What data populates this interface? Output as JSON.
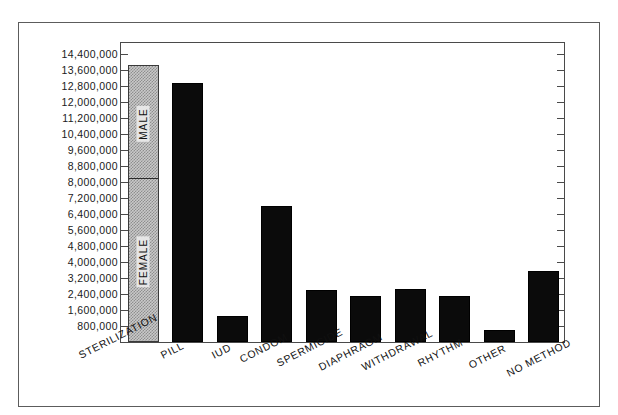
{
  "chart_data": {
    "type": "bar",
    "title": "",
    "subtitle": "",
    "xlabel": "",
    "ylabel": "",
    "grid": false,
    "legend_position": "in-bar",
    "ylim": [
      0,
      14800000
    ],
    "y_tick_step": 800000,
    "y_tick_labels": [
      "14,400,000",
      "13,600,000",
      "12,800,000",
      "12,000,000",
      "11,200,000",
      "10,400,000",
      "9,600,000",
      "8,800,000",
      "8,000,000",
      "7,200,000",
      "6,400,000",
      "5,600,000",
      "4,800,000",
      "4,000,000",
      "3,200,000",
      "2,400,000",
      "1,600,000",
      "800,000"
    ],
    "y_tick_values": [
      14400000,
      13600000,
      12800000,
      12000000,
      11200000,
      10400000,
      9600000,
      8800000,
      8000000,
      7200000,
      6400000,
      5600000,
      4800000,
      4000000,
      3200000,
      2400000,
      1600000,
      800000
    ],
    "categories": [
      "STERILIZATION",
      "PILL",
      "IUD",
      "CONDOM",
      "SPERMICIDE",
      "DIAPHRAGM",
      "WITHDRAWAL",
      "RHYTHM",
      "OTHER",
      "NO METHOD"
    ],
    "values": [
      13850000,
      12950000,
      1300000,
      6800000,
      2600000,
      2300000,
      2650000,
      2300000,
      600000,
      3550000
    ],
    "stacked_first_bar": {
      "category": "STERILIZATION",
      "segments": [
        {
          "name": "FEMALE",
          "value": 8100000,
          "style": "stipple"
        },
        {
          "name": "MALE",
          "value": 5750000,
          "style": "stipple"
        }
      ],
      "total": 13850000
    },
    "series": [
      {
        "name": "Users",
        "values": [
          13850000,
          12950000,
          1300000,
          6800000,
          2600000,
          2300000,
          2650000,
          2300000,
          600000,
          3550000
        ]
      }
    ],
    "colors": {
      "bar_solid": "#0b0b0b",
      "bar_stipple_fill": "#c9c9c9",
      "bar_stipple_dots": "#8e8e8e",
      "axis": "#4a4a4a",
      "frame": "#5c5c5c",
      "text": "#111111",
      "background": "#ffffff"
    }
  }
}
